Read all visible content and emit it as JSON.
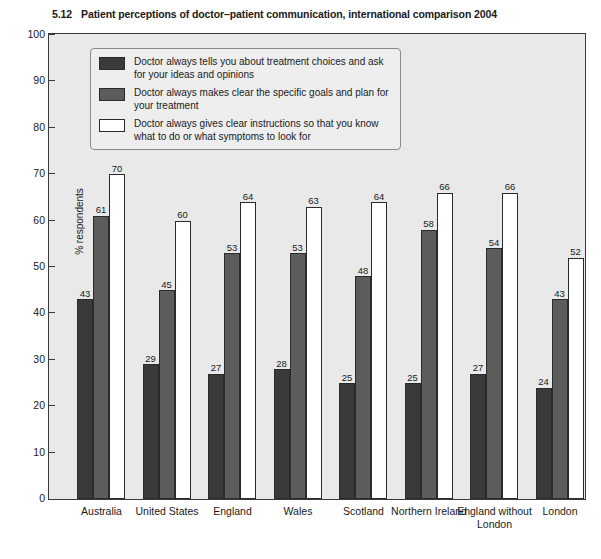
{
  "title": {
    "number": "5.12",
    "text": "Patient perceptions of doctor–patient communication, international comparison 2004"
  },
  "legend": {
    "items": [
      {
        "label": "Doctor always tells you about treatment choices and ask for your ideas and opinions",
        "color": "#3a3a3a"
      },
      {
        "label": "Doctor always makes clear the specific goals and plan for your treatment",
        "color": "#5c5c5c"
      },
      {
        "label": "Doctor always gives clear instructions so that you know what to do or what symptoms to look for",
        "color": "#ffffff"
      }
    ]
  },
  "chart_data": {
    "type": "bar",
    "title": "Patient perceptions of doctor–patient communication, international comparison 2004",
    "xlabel": "",
    "ylabel": "% respondents",
    "ylim": [
      0,
      100
    ],
    "ytick_step": 10,
    "yticks": [
      "100",
      "90",
      "80",
      "70",
      "60",
      "50",
      "40",
      "30",
      "20",
      "10",
      "0"
    ],
    "grid": false,
    "legend_position": "upper-left-inside",
    "categories": [
      "Australia",
      "United States",
      "England",
      "Wales",
      "Scotland",
      "Northern Ireland",
      "England without London",
      "London"
    ],
    "series": [
      {
        "name": "Doctor always tells you about treatment choices and ask for your ideas and opinions",
        "color": "#3a3a3a",
        "values": [
          43,
          29,
          27,
          28,
          25,
          25,
          27,
          24
        ]
      },
      {
        "name": "Doctor always makes clear the specific goals and plan for your treatment",
        "color": "#5c5c5c",
        "values": [
          61,
          45,
          53,
          53,
          48,
          58,
          54,
          43
        ]
      },
      {
        "name": "Doctor always gives clear instructions so that you know what to do or what symptoms to look for",
        "color": "#ffffff",
        "values": [
          70,
          60,
          64,
          63,
          64,
          66,
          66,
          52
        ]
      }
    ]
  },
  "axis": {
    "y_title": "% respondents"
  }
}
